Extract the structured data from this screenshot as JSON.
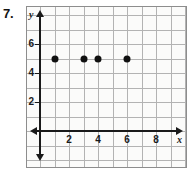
{
  "problem": {
    "number": "7."
  },
  "chart_data": {
    "type": "scatter",
    "title": "",
    "xlabel": "x",
    "ylabel": "y",
    "x": [
      1,
      3,
      4,
      6
    ],
    "y": [
      5,
      5,
      5,
      5
    ],
    "points": [
      {
        "x": 1,
        "y": 5
      },
      {
        "x": 3,
        "y": 5
      },
      {
        "x": 4,
        "y": 5
      },
      {
        "x": 6,
        "y": 5
      }
    ],
    "xlim": [
      -1,
      9
    ],
    "ylim": [
      -1,
      9
    ],
    "xticks": [
      2,
      4,
      6,
      8
    ],
    "yticks": [
      2,
      4,
      6
    ],
    "xtick_labels": [
      "2",
      "4",
      "6",
      "8"
    ],
    "ytick_labels": [
      "2",
      "4",
      "6"
    ],
    "grid": true,
    "grid_spacing": 1,
    "legend": "none",
    "axis_arrows": [
      "up",
      "down",
      "left",
      "right"
    ]
  },
  "colors": {
    "point": "#101010",
    "axis": "#1a1a1a",
    "grid": "#b3b3b3",
    "frame": "#8d8d8d",
    "background": "#fbfbfa"
  }
}
